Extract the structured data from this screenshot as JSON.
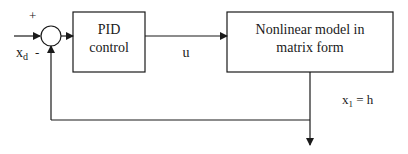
{
  "diagram": {
    "type": "block-diagram",
    "title": "",
    "input": {
      "label": "x",
      "subscript": "d"
    },
    "summing_junction": {
      "plus_sign": "+",
      "minus_sign": "-"
    },
    "blocks": [
      {
        "id": "pid",
        "line1": "PID",
        "line2": "control"
      },
      {
        "id": "plant",
        "line1": "Nonlinear model in",
        "line2": "matrix form"
      }
    ],
    "signals": {
      "control": "u",
      "output": {
        "label": "x",
        "subscript": "1",
        "suffix": " = h"
      }
    },
    "colors": {
      "stroke": "#1a1a1a",
      "background": "#ffffff"
    }
  }
}
